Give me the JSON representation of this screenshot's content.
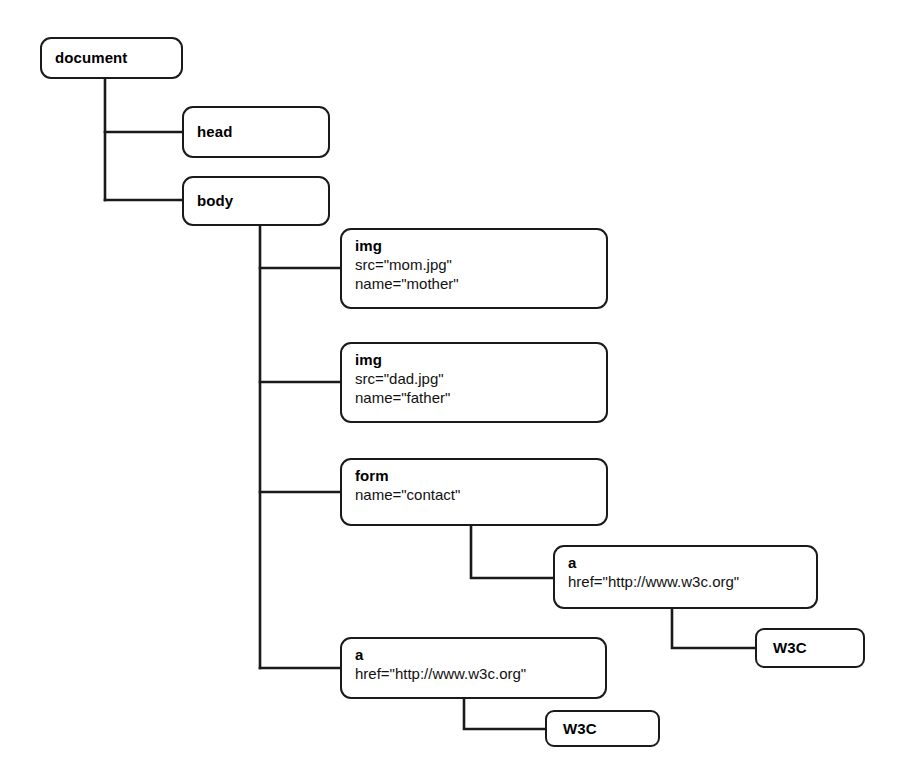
{
  "diagram": {
    "type": "tree",
    "background_color": "#ffffff",
    "line_color": "#1a1a1a",
    "text_color": "#000000"
  },
  "nodes": {
    "document": {
      "tag": "document",
      "attrs": []
    },
    "head": {
      "tag": "head",
      "attrs": []
    },
    "body": {
      "tag": "body",
      "attrs": []
    },
    "img_mother": {
      "tag": "img",
      "attrs": [
        "src=\"mom.jpg\"",
        "name=\"mother\""
      ]
    },
    "img_father": {
      "tag": "img",
      "attrs": [
        "src=\"dad.jpg\"",
        "name=\"father\""
      ]
    },
    "form_contact": {
      "tag": "form",
      "attrs": [
        "name=\"contact\""
      ]
    },
    "anchor_in_form": {
      "tag": "a",
      "attrs": [
        "href=\"http://www.w3c.org\""
      ]
    },
    "text_w3c_in_form": {
      "tag": "W3C",
      "attrs": []
    },
    "anchor_in_body": {
      "tag": "a",
      "attrs": [
        "href=\"http://www.w3c.org\""
      ]
    },
    "text_w3c_in_body": {
      "tag": "W3C",
      "attrs": []
    }
  },
  "edges": [
    {
      "from": "document",
      "to": "head"
    },
    {
      "from": "document",
      "to": "body"
    },
    {
      "from": "body",
      "to": "img_mother"
    },
    {
      "from": "body",
      "to": "img_father"
    },
    {
      "from": "body",
      "to": "form_contact"
    },
    {
      "from": "body",
      "to": "anchor_in_body"
    },
    {
      "from": "form_contact",
      "to": "anchor_in_form"
    },
    {
      "from": "anchor_in_form",
      "to": "text_w3c_in_form"
    },
    {
      "from": "anchor_in_body",
      "to": "text_w3c_in_body"
    }
  ]
}
